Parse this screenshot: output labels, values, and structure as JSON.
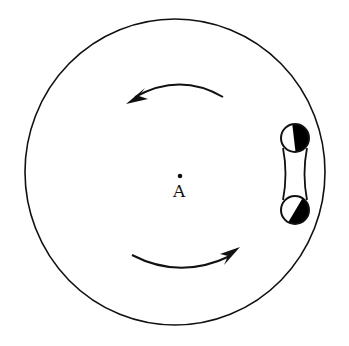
{
  "diagram": {
    "type": "rotating-platform",
    "center_label": "A",
    "colors": {
      "stroke": "#111111",
      "background": "#ffffff",
      "fill": "#000000"
    },
    "elements": [
      {
        "name": "platform-circle"
      },
      {
        "name": "rotation-arrow-top",
        "direction": "counterclockwise"
      },
      {
        "name": "rotation-arrow-bottom",
        "direction": "counterclockwise"
      },
      {
        "name": "center-point",
        "label": "A"
      },
      {
        "name": "cart-with-two-wheels"
      }
    ]
  }
}
